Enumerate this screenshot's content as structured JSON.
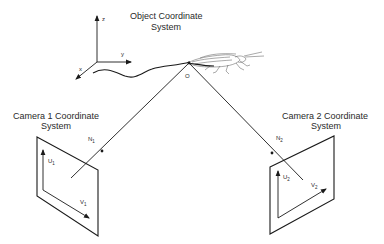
{
  "diagram": {
    "object_system": {
      "title_line1": "Object Coordinate",
      "title_line2": "System",
      "axes": {
        "z": "z",
        "y": "y",
        "x": "x"
      },
      "origin_label": "O"
    },
    "camera1": {
      "title_line1": "Camera 1 Coordinate",
      "title_line2": "System",
      "normal_label": "N",
      "normal_sub": "1",
      "u_label": "U",
      "u_sub": "1",
      "v_label": "V",
      "v_sub": "1"
    },
    "camera2": {
      "title_line1": "Camera 2 Coordinate",
      "title_line2": "System",
      "normal_label": "N",
      "normal_sub": "2",
      "u_label": "U",
      "u_sub": "2",
      "v_label": "V",
      "v_sub": "2"
    },
    "colors": {
      "stroke": "#1a1a1a",
      "text": "#2a2a2a",
      "background": "#ffffff"
    }
  }
}
